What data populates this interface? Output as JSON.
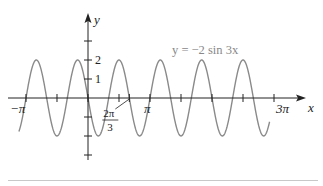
{
  "figure": {
    "caption": "FIGURE 5"
  },
  "chart_data": {
    "type": "line",
    "title": "y = −2 sin 3x",
    "function": "y = -2 sin(3x)",
    "xlabel": "x",
    "ylabel": "y",
    "x_ticks": [
      {
        "value": -3.14159,
        "label": "−π"
      },
      {
        "value": 2.0944,
        "label": "2π/3",
        "numerator": "2π",
        "denominator": "3"
      },
      {
        "value": 3.14159,
        "label": "π"
      },
      {
        "value": 9.42478,
        "label": "3π"
      }
    ],
    "x_minor_ticks": [
      -3.14159,
      -1.5708,
      0,
      1.5708,
      2.0944,
      3.14159,
      4.7124,
      6.2832,
      7.854,
      9.42478
    ],
    "y_ticks": [
      {
        "value": 3,
        "label": ""
      },
      {
        "value": 2,
        "label": "2"
      },
      {
        "value": 1,
        "label": "1"
      },
      {
        "value": -1,
        "label": ""
      },
      {
        "value": -2,
        "label": ""
      },
      {
        "value": -3,
        "label": ""
      }
    ],
    "xlim": [
      -3.5,
      10.5
    ],
    "ylim": [
      -3.5,
      4.3
    ],
    "amplitude": 2,
    "period": "2π/3",
    "curve_domain": [
      -3.5,
      9.2
    ],
    "colors": {
      "curve": "#8a8a8a",
      "axes": "#222222",
      "label": "#888888"
    },
    "grid": false
  }
}
